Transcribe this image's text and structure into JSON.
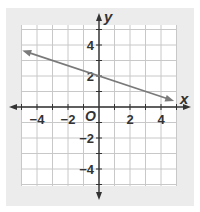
{
  "chart_data": {
    "type": "line",
    "title": "",
    "xlabel": "x",
    "ylabel": "y",
    "origin_label": "O",
    "xlim": [
      -5,
      5
    ],
    "ylim": [
      -5,
      5
    ],
    "grid": true,
    "x_tick_labels": [
      "−4",
      "−2",
      "2",
      "4"
    ],
    "x_tick_values": [
      -4,
      -2,
      2,
      4
    ],
    "y_tick_labels": [
      "4",
      "2",
      "−2",
      "−4"
    ],
    "y_tick_values": [
      4,
      2,
      -2,
      -4
    ],
    "series": [
      {
        "name": "line",
        "equation": "y = -1/3 x + 2",
        "slope": -0.3333,
        "intercept": 2,
        "x": [
          -5,
          -3,
          0,
          3,
          4.8
        ],
        "y": [
          3.67,
          3,
          2,
          1,
          0.4
        ],
        "arrows": "both",
        "color": "#7a7a7a"
      }
    ]
  },
  "colors": {
    "panel": "#ececec",
    "grid_bg": "#ffffff",
    "grid_line": "#c8c8c8",
    "axis": "#333333",
    "line": "#7a7a7a"
  }
}
